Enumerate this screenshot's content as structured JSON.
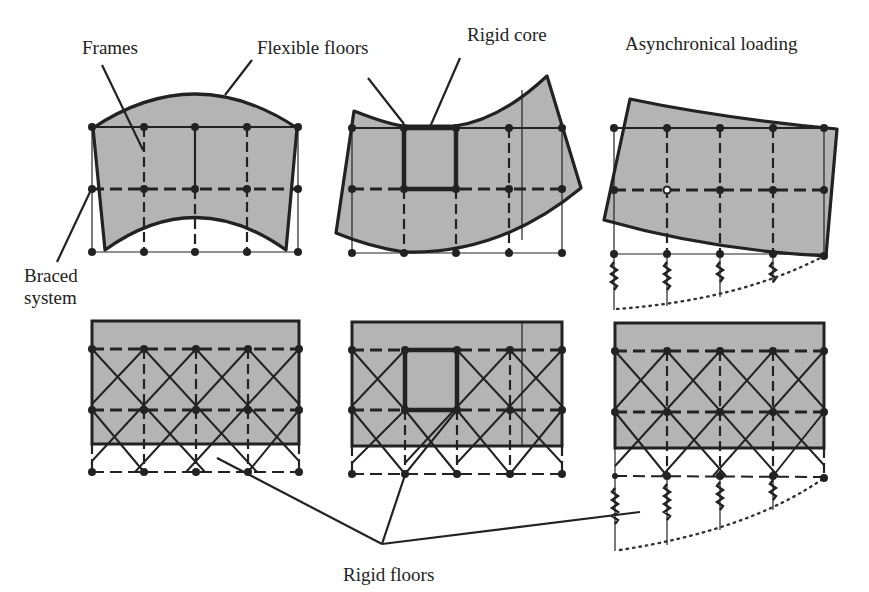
{
  "figure": {
    "labels": {
      "frames": "Frames",
      "flexible_floors": "Flexible floors",
      "rigid_core": "Rigid core",
      "asynchronical_loading": "Asynchronical loading",
      "braced_line1": "Braced",
      "braced_line2": "system",
      "rigid_floors": "Rigid floors"
    },
    "panels": [
      {
        "row": 1,
        "col": 1,
        "system": "frames",
        "floors": "flexible",
        "core": false,
        "supports": "fixed",
        "deformation": "convex-upward floor"
      },
      {
        "row": 1,
        "col": 2,
        "system": "frames",
        "floors": "flexible",
        "core": true,
        "supports": "fixed",
        "deformation": "concave floor"
      },
      {
        "row": 1,
        "col": 3,
        "system": "frames",
        "floors": "flexible",
        "core": false,
        "supports": "springs",
        "deformation": "tilted, asynchronical loading"
      },
      {
        "row": 2,
        "col": 1,
        "system": "braced",
        "floors": "rigid",
        "core": false,
        "supports": "fixed"
      },
      {
        "row": 2,
        "col": 2,
        "system": "braced",
        "floors": "rigid",
        "core": true,
        "supports": "fixed"
      },
      {
        "row": 2,
        "col": 3,
        "system": "braced",
        "floors": "rigid",
        "core": false,
        "supports": "springs"
      }
    ],
    "colors": {
      "floor_fill": "#b4b4b4",
      "line": "#222222",
      "background": "#ffffff"
    }
  }
}
